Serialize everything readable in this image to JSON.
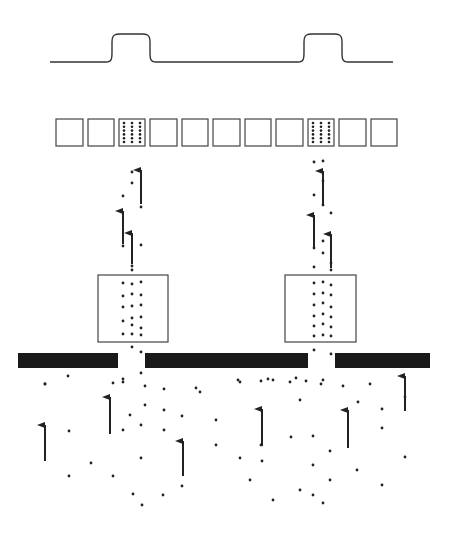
{
  "diagram": {
    "title": "",
    "colors": {
      "background": "#ffffff",
      "ink": "#222222",
      "barrier": "#1a1a1a",
      "cell_stroke": "#444444"
    },
    "signal_trace": {
      "baseline_y": 62,
      "peak_y": 34,
      "x_start": 50,
      "x_end": 393,
      "peaks": [
        {
          "x_left": 112,
          "x_right": 150
        },
        {
          "x_left": 304,
          "x_right": 342
        }
      ]
    },
    "cell_row": {
      "y": 119,
      "height": 27,
      "cells": [
        {
          "x": 56,
          "w": 27,
          "filled": false
        },
        {
          "x": 88,
          "w": 26,
          "filled": false
        },
        {
          "x": 119,
          "w": 26,
          "filled": true
        },
        {
          "x": 150,
          "w": 27,
          "filled": false
        },
        {
          "x": 182,
          "w": 26,
          "filled": false
        },
        {
          "x": 213,
          "w": 27,
          "filled": false
        },
        {
          "x": 245,
          "w": 26,
          "filled": false
        },
        {
          "x": 276,
          "w": 27,
          "filled": false
        },
        {
          "x": 308,
          "w": 26,
          "filled": true
        },
        {
          "x": 339,
          "w": 27,
          "filled": false
        },
        {
          "x": 371,
          "w": 26,
          "filled": false
        }
      ],
      "dot_columns": 3,
      "dot_rows": 6
    },
    "boxes": [
      {
        "x": 98,
        "y": 275,
        "w": 70,
        "h": 67
      },
      {
        "x": 285,
        "y": 275,
        "w": 71,
        "h": 67
      }
    ],
    "barrier": {
      "y": 353,
      "height": 15,
      "segments": [
        {
          "x": 18,
          "w": 100
        },
        {
          "x": 145,
          "w": 163
        },
        {
          "x": 335,
          "w": 95
        }
      ]
    },
    "box_particles": [
      [
        123,
        283
      ],
      [
        132,
        284
      ],
      [
        141,
        282
      ],
      [
        123,
        296
      ],
      [
        132,
        294
      ],
      [
        141,
        295
      ],
      [
        123,
        307
      ],
      [
        132,
        306
      ],
      [
        141,
        305
      ],
      [
        132,
        318
      ],
      [
        141,
        317
      ],
      [
        123,
        321
      ],
      [
        132,
        325
      ],
      [
        141,
        328
      ],
      [
        123,
        334
      ],
      [
        132,
        334
      ],
      [
        141,
        335
      ],
      [
        314,
        283
      ],
      [
        323,
        282
      ],
      [
        331,
        285
      ],
      [
        314,
        294
      ],
      [
        323,
        293
      ],
      [
        331,
        295
      ],
      [
        314,
        305
      ],
      [
        323,
        303
      ],
      [
        331,
        307
      ],
      [
        314,
        316
      ],
      [
        323,
        314
      ],
      [
        331,
        317
      ],
      [
        314,
        326
      ],
      [
        323,
        324
      ],
      [
        331,
        327
      ],
      [
        314,
        336
      ],
      [
        323,
        335
      ],
      [
        331,
        336
      ]
    ],
    "upper_particles": [
      [
        132,
        172
      ],
      [
        132,
        183
      ],
      [
        123,
        196
      ],
      [
        141,
        207
      ],
      [
        123,
        246
      ],
      [
        141,
        245
      ],
      [
        132,
        266
      ],
      [
        141,
        352
      ],
      [
        123,
        382
      ],
      [
        141,
        373
      ],
      [
        132,
        347
      ],
      [
        132,
        270
      ],
      [
        323,
        161
      ],
      [
        314,
        162
      ],
      [
        323,
        181
      ],
      [
        314,
        195
      ],
      [
        323,
        205
      ],
      [
        331,
        213
      ],
      [
        314,
        248
      ],
      [
        323,
        241
      ],
      [
        331,
        263
      ],
      [
        314,
        267
      ],
      [
        331,
        270
      ],
      [
        323,
        253
      ],
      [
        314,
        350
      ],
      [
        331,
        354
      ],
      [
        323,
        380
      ]
    ],
    "lower_particles": [
      [
        45,
        384
      ],
      [
        68,
        376
      ],
      [
        123,
        379
      ],
      [
        145,
        386
      ],
      [
        164,
        389
      ],
      [
        196,
        388
      ],
      [
        238,
        380
      ],
      [
        261,
        381
      ],
      [
        268,
        379
      ],
      [
        296,
        378
      ],
      [
        306,
        381
      ],
      [
        321,
        384
      ],
      [
        343,
        386
      ],
      [
        370,
        384
      ],
      [
        45,
        384
      ],
      [
        69,
        431
      ],
      [
        113,
        383
      ],
      [
        145,
        405
      ],
      [
        130,
        415
      ],
      [
        123,
        430
      ],
      [
        141,
        425
      ],
      [
        141,
        458
      ],
      [
        164,
        410
      ],
      [
        164,
        430
      ],
      [
        182,
        416
      ],
      [
        200,
        392
      ],
      [
        216,
        420
      ],
      [
        216,
        445
      ],
      [
        240,
        382
      ],
      [
        240,
        458
      ],
      [
        261,
        410
      ],
      [
        261,
        445
      ],
      [
        273,
        380
      ],
      [
        290,
        382
      ],
      [
        291,
        437
      ],
      [
        300,
        400
      ],
      [
        313,
        436
      ],
      [
        313,
        465
      ],
      [
        330,
        451
      ],
      [
        330,
        480
      ],
      [
        357,
        470
      ],
      [
        358,
        402
      ],
      [
        382,
        409
      ],
      [
        382,
        428
      ],
      [
        405,
        397
      ],
      [
        405,
        457
      ],
      [
        382,
        485
      ],
      [
        69,
        476
      ],
      [
        91,
        463
      ],
      [
        113,
        476
      ],
      [
        133,
        494
      ],
      [
        142,
        505
      ],
      [
        163,
        495
      ],
      [
        182,
        486
      ],
      [
        250,
        480
      ],
      [
        262,
        461
      ],
      [
        273,
        500
      ],
      [
        300,
        490
      ],
      [
        313,
        495
      ],
      [
        323,
        503
      ]
    ],
    "arrows": [
      {
        "x": 141,
        "y1": 204,
        "y2": 170
      },
      {
        "x": 123,
        "y1": 244,
        "y2": 211
      },
      {
        "x": 132,
        "y1": 264,
        "y2": 233
      },
      {
        "x": 323,
        "y1": 205,
        "y2": 171
      },
      {
        "x": 314,
        "y1": 248,
        "y2": 215
      },
      {
        "x": 331,
        "y1": 268,
        "y2": 234
      },
      {
        "x": 45,
        "y1": 461,
        "y2": 425
      },
      {
        "x": 110,
        "y1": 434,
        "y2": 397
      },
      {
        "x": 183,
        "y1": 476,
        "y2": 441
      },
      {
        "x": 262,
        "y1": 446,
        "y2": 409
      },
      {
        "x": 348,
        "y1": 448,
        "y2": 410
      },
      {
        "x": 405,
        "y1": 411,
        "y2": 376
      }
    ]
  }
}
